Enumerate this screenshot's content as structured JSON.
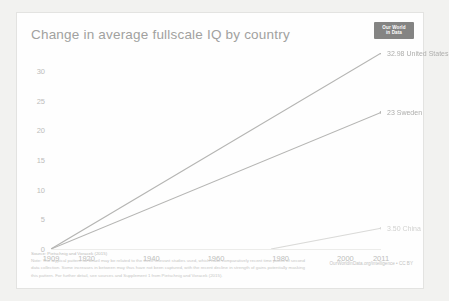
{
  "chart_card": {
    "title": "Change in average fullscale IQ by country",
    "logo": {
      "line1": "Our World",
      "line2": "in Data"
    },
    "credit": "OurWorldInData.org/intelligence • CC BY",
    "footer": {
      "source": "Source: Pietschnig and Voracek (2015)",
      "note_line1": "Note: The atypical pattern for Brazil may be related to the three relevant studies used, which have comparatively recent time points of second",
      "note_line2": "data collection. Some increases in between may thus have not been captured, with the recent decline in strength of gains potentially masking",
      "note_line3": "this pattern. For further detail, see sources and Supplement 1 from Pietschnig and Voracek (2015)."
    }
  },
  "chart_data": {
    "type": "line",
    "title": "Change in average fullscale IQ by country",
    "xlabel": "",
    "ylabel": "",
    "xlim": [
      1909,
      2011
    ],
    "ylim": [
      0,
      33
    ],
    "grid": false,
    "legend": "inline-right",
    "yticks": [
      0,
      5,
      10,
      15,
      20,
      25,
      30
    ],
    "ytick_labels": [
      "0",
      "5",
      "10",
      "15",
      "20",
      "25",
      "30"
    ],
    "xticks": [
      1909,
      1920,
      1940,
      1960,
      1980,
      2000,
      2011
    ],
    "xtick_labels": [
      "1909",
      "1920",
      "1940",
      "1960",
      "1980",
      "2000",
      "2011"
    ],
    "series": [
      {
        "name": "United States",
        "color": "#b0b0ae",
        "end_value": 32.98,
        "end_label": "32.98 United States",
        "x": [
          1909,
          2011
        ],
        "values": [
          0,
          32.98
        ]
      },
      {
        "name": "Sweden",
        "color": "#b0b0ae",
        "end_value": 23,
        "end_label": "23 Sweden",
        "x": [
          1909,
          2011
        ],
        "values": [
          0,
          23
        ]
      },
      {
        "name": "China",
        "color": "#d8d8d6",
        "end_value": 3.5,
        "end_label": "3.50 China",
        "x": [
          1977,
          2011
        ],
        "values": [
          0,
          3.5
        ]
      }
    ]
  }
}
